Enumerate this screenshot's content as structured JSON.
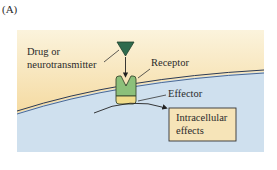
{
  "figure": {
    "panel_label": "(A)",
    "labels": {
      "ligand_line1": "Drug or",
      "ligand_line2": "neurotransmitter",
      "receptor": "Receptor",
      "effector": "Effector",
      "effects_line1": "Intracellular",
      "effects_line2": "effects"
    },
    "colors": {
      "extracellular_top": "#fbf3dc",
      "extracellular_bottom": "#f2cf86",
      "intracellular": "#cfe0ee",
      "membrane_line": "#2b3a55",
      "ligand": "#2f6b4e",
      "receptor": "#8cc07a",
      "effector": "#f1dc8a",
      "effects_box": "#f6e4b8"
    }
  }
}
